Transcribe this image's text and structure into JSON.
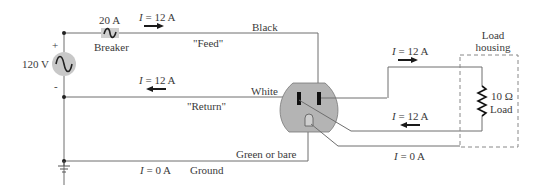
{
  "diagram": {
    "type": "household wiring circuit",
    "source": {
      "label": "120 V",
      "plus": "+",
      "minus": "-",
      "icon": "ac-source-icon"
    },
    "breaker": {
      "rating": "20 A",
      "label": "Breaker"
    },
    "wires": {
      "feed": {
        "color_label": "Black",
        "role": "\"Feed\"",
        "current": "I = 12 A",
        "current_var": "I",
        "current_val": "= 12 A"
      },
      "return": {
        "color_label": "White",
        "role": "\"Return\"",
        "current": "I = 12 A",
        "current_var": "I",
        "current_val": "= 12 A"
      },
      "ground": {
        "color_label": "Green or bare",
        "role": "Ground",
        "current": "I = 0 A",
        "current_var": "I",
        "current_val": "= 0 A"
      }
    },
    "load_side": {
      "top_current_var": "I",
      "top_current_val": "= 12 A",
      "bottom_current_var": "I",
      "bottom_current_val": "= 12 A",
      "ground_current_var": "I",
      "ground_current_val": "= 0 A"
    },
    "load": {
      "housing_line1": "Load",
      "housing_line2": "housing",
      "resistance": "10 Ω",
      "label": "Load"
    },
    "colors": {
      "wire": "#6e6e6e",
      "outlet": "#b4b4b4",
      "source": "#c8c8c8",
      "arrow": "#1a1a1a",
      "housing": "#888888"
    }
  }
}
